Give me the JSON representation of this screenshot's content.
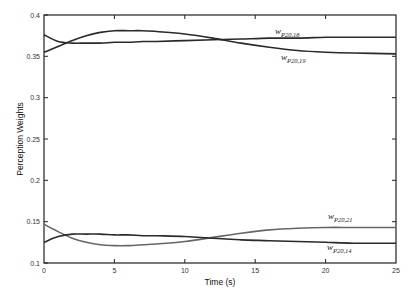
{
  "chart_data": {
    "type": "line",
    "title": "",
    "xlabel": "Time (s)",
    "ylabel": "Perception Weights",
    "xlim": [
      0,
      25
    ],
    "ylim": [
      0.1,
      0.4
    ],
    "grid": false,
    "legend": "inline labels",
    "x_ticks": [
      "0",
      "5",
      "10",
      "15",
      "20",
      "25"
    ],
    "y_ticks": [
      "0.1",
      "0.15",
      "0.2",
      "0.25",
      "0.3",
      "0.35",
      "0.4"
    ],
    "x": [
      0,
      1,
      2,
      3,
      4,
      5,
      6,
      7,
      8,
      10,
      12,
      14,
      16,
      18,
      20,
      22,
      25
    ],
    "series": [
      {
        "name": "w_{P20,18}",
        "label_main": "w",
        "label_sub": "P20,18",
        "color": "#2a2a2a",
        "values": [
          0.376,
          0.368,
          0.366,
          0.366,
          0.366,
          0.367,
          0.367,
          0.368,
          0.368,
          0.369,
          0.37,
          0.371,
          0.372,
          0.372,
          0.373,
          0.373,
          0.373
        ]
      },
      {
        "name": "w_{P20,19}",
        "label_main": "w",
        "label_sub": "P20,19",
        "color": "#2a2a2a",
        "values": [
          0.355,
          0.362,
          0.369,
          0.375,
          0.379,
          0.381,
          0.381,
          0.381,
          0.38,
          0.377,
          0.372,
          0.366,
          0.361,
          0.357,
          0.355,
          0.354,
          0.353
        ]
      },
      {
        "name": "w_{P20,21}",
        "label_main": "w",
        "label_sub": "P20,21",
        "color": "#666666",
        "values": [
          0.147,
          0.138,
          0.13,
          0.125,
          0.122,
          0.121,
          0.121,
          0.122,
          0.123,
          0.126,
          0.131,
          0.136,
          0.14,
          0.142,
          0.143,
          0.143,
          0.143
        ]
      },
      {
        "name": "w_{P20,14}",
        "label_main": "w",
        "label_sub": "P20,14",
        "color": "#2a2a2a",
        "values": [
          0.125,
          0.132,
          0.135,
          0.135,
          0.135,
          0.134,
          0.134,
          0.133,
          0.133,
          0.132,
          0.13,
          0.128,
          0.127,
          0.126,
          0.125,
          0.124,
          0.124
        ]
      }
    ]
  },
  "labels": {
    "xlabel": "Time (s)",
    "ylabel": "Perception Weights",
    "x_ticks": [
      "0",
      "5",
      "10",
      "15",
      "20",
      "25"
    ],
    "y_ticks": [
      "0.1",
      "0.15",
      "0.2",
      "0.25",
      "0.3",
      "0.35",
      "0.4"
    ],
    "series": [
      {
        "main": "w",
        "sub": "P20,18"
      },
      {
        "main": "w",
        "sub": "P20,19"
      },
      {
        "main": "w",
        "sub": "P20,21"
      },
      {
        "main": "w",
        "sub": "P20,14"
      }
    ]
  }
}
